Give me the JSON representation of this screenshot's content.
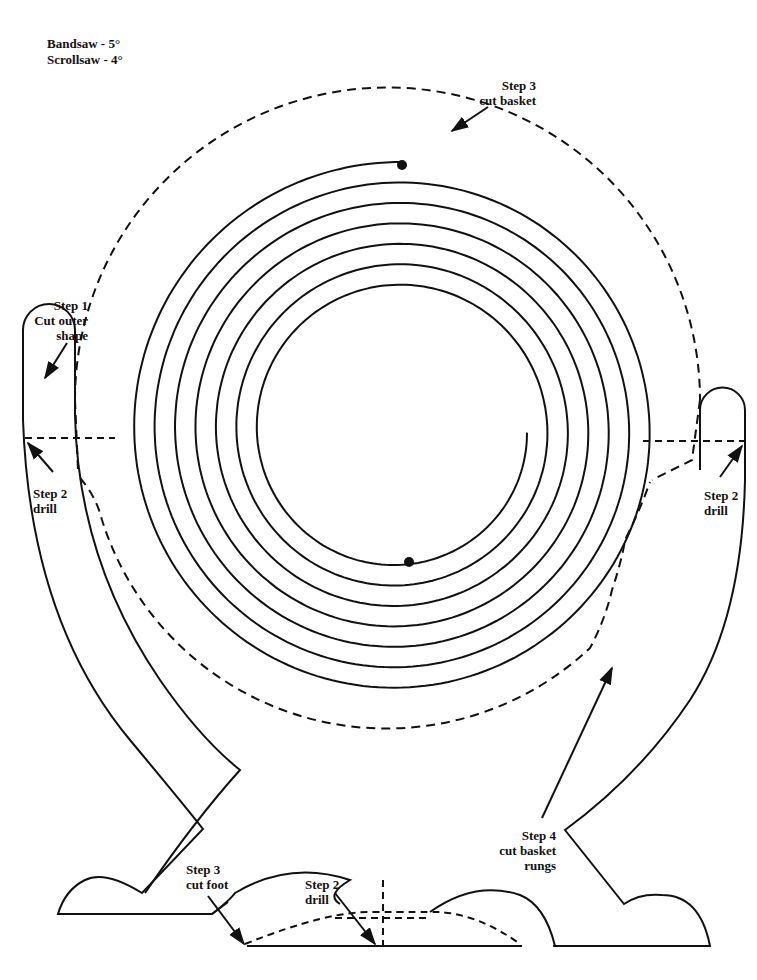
{
  "header": {
    "bandsaw": "Bandsaw - 5°",
    "scrollsaw": "Scrollsaw - 4°"
  },
  "labels": {
    "step3_basket": {
      "line1": "Step 3",
      "line2": "cut basket"
    },
    "step1": {
      "line1": "Step 1",
      "line2": "Cut outer",
      "line3": "shape"
    },
    "step2_left": {
      "line1": "Step 2",
      "line2": "drill"
    },
    "step2_right": {
      "line1": "Step 2",
      "line2": "drill"
    },
    "step4": {
      "line1": "Step 4",
      "line2": "cut basket",
      "line3": "rungs"
    },
    "step3_foot": {
      "line1": "Step 3",
      "line2": "cut foot"
    },
    "step2_bottom": {
      "line1": "Step 2",
      "line2": "drill"
    }
  },
  "colors": {
    "line": "#111111",
    "background": "#ffffff"
  }
}
